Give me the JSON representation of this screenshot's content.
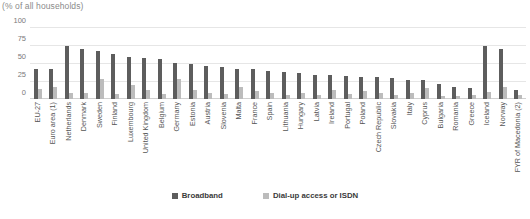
{
  "chart_data": {
    "type": "bar",
    "title": "(% of all households)",
    "xlabel": "",
    "ylabel": "",
    "ylim": [
      0,
      100
    ],
    "yticks": [
      100,
      75,
      50,
      25,
      0
    ],
    "grid": true,
    "legend_position": "bottom",
    "categories": [
      "EU-27",
      "Euro area (1)",
      "Netherlands",
      "Denmark",
      "Sweden",
      "Finland",
      "Luxembourg",
      "United Kingdom",
      "Belgium",
      "Germany",
      "Estonia",
      "Austria",
      "Slovenia",
      "Malta",
      "France",
      "Spain",
      "Lithuania",
      "Hungary",
      "Latvia",
      "Ireland",
      "Portugal",
      "Poland",
      "Czech Republic",
      "Slovakia",
      "Italy",
      "Cyprus",
      "Bulgaria",
      "Romania",
      "Greece",
      "Iceland",
      "Norway",
      "FYR of Macedonia (2)"
    ],
    "series": [
      {
        "name": "Broadband",
        "color": "#5d5d5d",
        "values": [
          42,
          42,
          74,
          70,
          67,
          62,
          58,
          57,
          56,
          50,
          48,
          46,
          44,
          42,
          41,
          39,
          38,
          36,
          34,
          33,
          32,
          31,
          30,
          29,
          27,
          26,
          21,
          17,
          15,
          74,
          69,
          12
        ]
      },
      {
        "name": "Dial-up access or ISDN",
        "color": "#bcbcbc",
        "values": [
          14,
          16,
          9,
          9,
          28,
          7,
          20,
          13,
          7,
          28,
          12,
          8,
          7,
          17,
          11,
          9,
          6,
          9,
          5,
          12,
          7,
          11,
          9,
          6,
          8,
          15,
          4,
          4,
          6,
          10,
          17,
          5
        ]
      }
    ]
  },
  "legend": {
    "items": [
      {
        "label": "Broadband",
        "key": "broadband"
      },
      {
        "label": "Dial-up access or ISDN",
        "key": "dialup"
      }
    ]
  }
}
